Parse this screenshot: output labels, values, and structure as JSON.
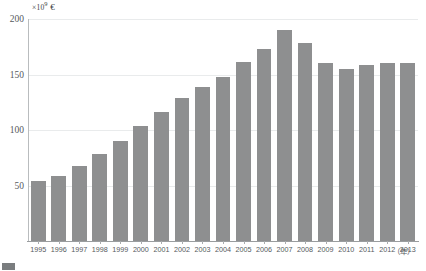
{
  "chart_data": {
    "type": "bar",
    "title": "",
    "subtitle": "",
    "unit_label": "×10⁹ €",
    "unit_multiplier": "×10",
    "unit_exponent": "9",
    "unit_currency": "€",
    "xlabel": "（年）",
    "ylabel": "",
    "ylim": [
      0,
      200
    ],
    "yticks": [
      50,
      100,
      150,
      200
    ],
    "ytick_labels": [
      "50",
      "100",
      "150",
      "200"
    ],
    "grid": true,
    "legend": "none",
    "categories": [
      "1995",
      "1996",
      "1997",
      "1998",
      "1999",
      "2000",
      "2001",
      "2002",
      "2003",
      "2004",
      "2005",
      "2006",
      "2007",
      "2008",
      "2009",
      "2010",
      "2011",
      "2012",
      "2013"
    ],
    "values": [
      54,
      59,
      68,
      78,
      90,
      104,
      116,
      129,
      139,
      148,
      161,
      173,
      190,
      178,
      160,
      155,
      159,
      160,
      160
    ],
    "bar_color": "#8e8f90",
    "grid_color": "#e9ebec",
    "axis_color": "#9a9d9f",
    "text_color": "#55595c"
  },
  "caption": {
    "text": "",
    "swatch_color": "#7a7d7f"
  }
}
